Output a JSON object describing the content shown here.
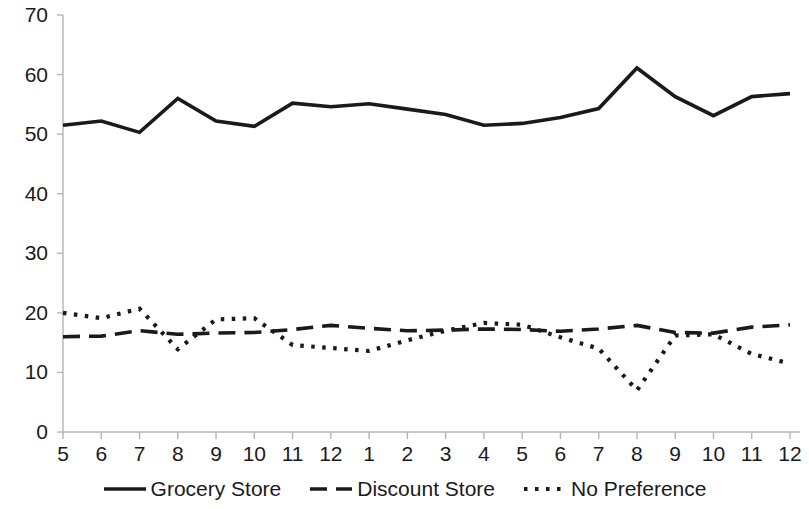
{
  "chart_data": {
    "type": "line",
    "title": "",
    "subtitle": "",
    "xlabel": "",
    "ylabel": "",
    "xlim": [
      0,
      19
    ],
    "ylim": [
      0,
      70
    ],
    "y_ticks": [
      0,
      10,
      20,
      30,
      40,
      50,
      60,
      70
    ],
    "x_ticks": [
      "5",
      "6",
      "7",
      "8",
      "9",
      "10",
      "11",
      "12",
      "1",
      "2",
      "3",
      "4",
      "5",
      "6",
      "7",
      "8",
      "9",
      "10",
      "11",
      "12"
    ],
    "grid": false,
    "legend_position": "bottom",
    "series": [
      {
        "name": "Grocery Store",
        "style": "solid",
        "color": "#1a1a1a",
        "values": [
          51.5,
          52.2,
          50.3,
          56.0,
          52.2,
          51.3,
          55.2,
          54.6,
          55.1,
          54.2,
          53.3,
          51.5,
          51.8,
          52.8,
          54.3,
          61.1,
          56.3,
          53.1,
          56.3,
          56.8
        ]
      },
      {
        "name": "Discount Store",
        "style": "dashed",
        "color": "#1a1a1a",
        "values": [
          16.0,
          16.1,
          17.0,
          16.4,
          16.6,
          16.7,
          17.2,
          17.9,
          17.4,
          17.0,
          17.1,
          17.3,
          17.2,
          16.9,
          17.3,
          17.9,
          16.7,
          16.6,
          17.6,
          18.0
        ]
      },
      {
        "name": "No Preference",
        "style": "dotted",
        "color": "#1a1a1a",
        "values": [
          20.0,
          19.1,
          20.7,
          13.9,
          18.9,
          19.1,
          14.6,
          14.1,
          13.6,
          15.4,
          17.0,
          18.3,
          18.0,
          15.9,
          14.0,
          7.0,
          16.2,
          16.4,
          13.1,
          11.5
        ]
      }
    ]
  },
  "axis": {
    "y_labels": [
      "70",
      "60",
      "50",
      "40",
      "30",
      "20",
      "10",
      "0"
    ],
    "x_labels": [
      "5",
      "6",
      "7",
      "8",
      "9",
      "10",
      "11",
      "12",
      "1",
      "2",
      "3",
      "4",
      "5",
      "6",
      "7",
      "8",
      "9",
      "10",
      "11",
      "12"
    ]
  },
  "legend": {
    "items": [
      {
        "label": "Grocery Store",
        "style": "solid"
      },
      {
        "label": "Discount Store",
        "style": "dashed"
      },
      {
        "label": "No Preference",
        "style": "dotted"
      }
    ]
  },
  "colors": {
    "line": "#1a1a1a",
    "axis": "#b4b4b4",
    "background": "#ffffff"
  }
}
